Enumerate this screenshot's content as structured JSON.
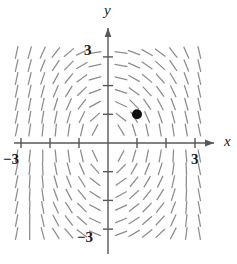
{
  "figure": {
    "type": "slope-field",
    "title": "",
    "background": "#ffffff"
  },
  "axes": {
    "x_axis_label": "x",
    "y_axis_label": "y",
    "x_tick_labels": [
      "−3",
      "3"
    ],
    "y_tick_labels": [
      "3",
      "−3"
    ],
    "x_label_left": "−3",
    "x_label_right": "3",
    "y_label_top": "3",
    "y_label_bottom": "−3",
    "xlim": [
      -3.45,
      3.45
    ],
    "ylim": [
      -3.45,
      3.45
    ],
    "x_ticks": [
      -3,
      -2,
      -1,
      1,
      2,
      3
    ],
    "y_ticks": [
      -3,
      -2,
      -1,
      1,
      2,
      3
    ],
    "axis_color": "#585858",
    "tick_color": "#585858",
    "arrow_x": "right",
    "arrow_y": "up"
  },
  "chart_data": {
    "type": "scatter",
    "title": "",
    "xlabel": "x",
    "ylabel": "y",
    "xlim": [
      -3.45,
      3.45
    ],
    "ylim": [
      -3.45,
      3.45
    ],
    "grid": false,
    "legend": null,
    "field": {
      "description": "direction field of short line segments on a uniform grid",
      "segment_color": "#8c8c8c",
      "segment_length_px": 13,
      "grid_x": [
        -3.15,
        -2.7,
        -2.25,
        -1.8,
        -1.35,
        -0.9,
        -0.45,
        0.45,
        0.9,
        1.35,
        1.8,
        2.25,
        2.7,
        3.15
      ],
      "grid_y": [
        3.15,
        2.7,
        2.25,
        1.8,
        1.35,
        0.9,
        0.45,
        -0.45,
        -0.9,
        -1.35,
        -1.8,
        -2.25,
        -2.7,
        -3.15
      ]
    },
    "points": [
      {
        "name": "initial-condition",
        "x": 1.0,
        "y": 1.0,
        "marker": "filled-circle",
        "color": "#111111",
        "radius_px": 5.0
      }
    ]
  },
  "marker": {
    "label": "",
    "x": 1.0,
    "y": 1.0
  }
}
